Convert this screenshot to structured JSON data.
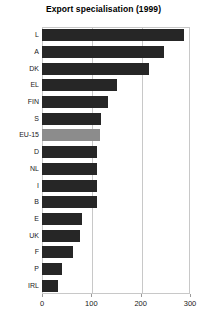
{
  "chart_data": {
    "type": "bar",
    "orientation": "horizontal",
    "title": "Export specialisation (1999)",
    "xlabel": "",
    "ylabel": "",
    "xlim": [
      0,
      300
    ],
    "xticks": [
      0,
      100,
      200,
      300
    ],
    "grid": true,
    "legend": "none",
    "bar_color": "#262626",
    "highlight_color": "#8c8c8c",
    "highlight_category": "EU-15",
    "categories": [
      "L",
      "A",
      "DK",
      "EL",
      "FIN",
      "S",
      "EU-15",
      "D",
      "NL",
      "I",
      "B",
      "E",
      "UK",
      "F",
      "P",
      "IRL"
    ],
    "values": [
      288,
      247,
      217,
      152,
      134,
      120,
      117,
      112,
      112,
      112,
      112,
      82,
      78,
      62,
      40,
      33
    ]
  }
}
